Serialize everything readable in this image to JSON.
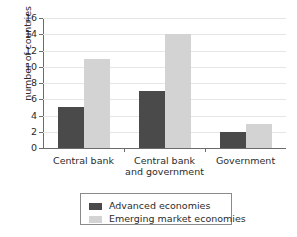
{
  "chart_data": {
    "type": "bar",
    "title": "",
    "xlabel": "",
    "ylabel": "number of countries",
    "categories": [
      "Central bank",
      "Central bank and government",
      "Government"
    ],
    "series": [
      {
        "name": "Advanced economies",
        "values": [
          5,
          7,
          2
        ],
        "color": "#4a4a4a"
      },
      {
        "name": "Emerging market economies",
        "values": [
          11,
          14,
          3
        ],
        "color": "#d3d3d3"
      }
    ],
    "ylim": [
      0,
      16
    ],
    "y_ticks": [
      0,
      2,
      4,
      6,
      8,
      10,
      12,
      14,
      16
    ],
    "y_tick_labels": [
      "0",
      "2",
      "4",
      "6",
      "8",
      "10",
      "12",
      "14",
      "16"
    ],
    "grid": true,
    "grid_axis": "y",
    "legend_position": "bottom",
    "background_color": "#ffffff",
    "axis_color": "#6b6b6b",
    "grid_color": "#e6e6e6"
  },
  "legend": {
    "items": [
      {
        "label": "Advanced economies",
        "color": "#4a4a4a"
      },
      {
        "label": "Emerging market economies",
        "color": "#d3d3d3"
      }
    ]
  }
}
